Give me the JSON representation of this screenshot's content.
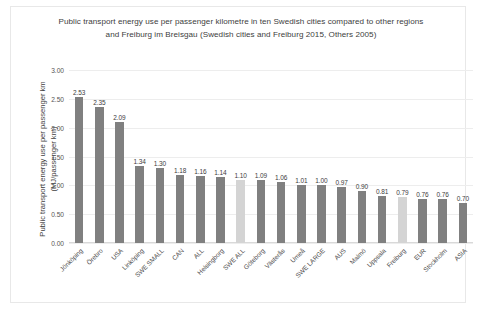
{
  "chart_data": {
    "type": "bar",
    "title": "Public transport energy use per passenger kilometre in ten Swedish cities compared to other regions and Freiburg im Breisgau (Swedish cities and Freiburg 2015, Others 2005)",
    "xlabel": "",
    "ylabel": "Public transport energy use per passenger km (MJ/passenger km)",
    "ylim": [
      0,
      3.0
    ],
    "ytick_labels": [
      "0.00",
      "0.50",
      "1.00",
      "1.50",
      "2.00",
      "2.50",
      "3.00"
    ],
    "ytick_values": [
      0,
      0.5,
      1.0,
      1.5,
      2.0,
      2.5,
      3.0
    ],
    "grid": true,
    "legend": "none",
    "bar_color": "#808080",
    "highlight_color": "#d4d4d4",
    "categories": [
      "Jönköping",
      "Örebro",
      "USA",
      "Linköping",
      "SWE SMALL",
      "CAN",
      "ALL",
      "Helsingborg",
      "SWE ALL",
      "Göteborg",
      "Västerås",
      "Umeå",
      "SWE LARGE",
      "AUS",
      "Malmö",
      "Uppsala",
      "Freiburg",
      "EUR",
      "Stockholm",
      "ASIA"
    ],
    "values": [
      2.53,
      2.35,
      2.09,
      1.34,
      1.3,
      1.18,
      1.16,
      1.14,
      1.1,
      1.09,
      1.06,
      1.01,
      1.0,
      0.97,
      0.9,
      0.81,
      0.79,
      0.76,
      0.76,
      0.7
    ],
    "value_labels": [
      "2.53",
      "2.35",
      "2.09",
      "1.34",
      "1.30",
      "1.18",
      "1.16",
      "1.14",
      "1.10",
      "1.09",
      "1.06",
      "1.01",
      "1.00",
      "0.97",
      "0.90",
      "0.81",
      "0.79",
      "0.76",
      "0.76",
      "0.70"
    ],
    "highlighted": [
      false,
      false,
      false,
      false,
      false,
      false,
      false,
      false,
      true,
      false,
      false,
      false,
      false,
      false,
      false,
      false,
      true,
      false,
      false,
      false
    ]
  }
}
